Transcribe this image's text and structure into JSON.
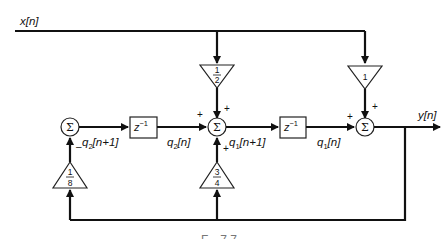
{
  "diagram": {
    "input_label": "x[n]",
    "output_label": "y[n]",
    "summers": [
      {
        "id": "sum1",
        "symbol": "Σ",
        "signs": {
          "feedback": "–"
        }
      },
      {
        "id": "sum2",
        "symbol": "Σ",
        "signs": {
          "left": "+",
          "top": "+",
          "bottom": "+"
        }
      },
      {
        "id": "sum3",
        "symbol": "Σ",
        "signs": {
          "left": "+",
          "top": "+"
        }
      }
    ],
    "delays": [
      {
        "id": "delay1",
        "label": "z",
        "exponent": "−1"
      },
      {
        "id": "delay2",
        "label": "z",
        "exponent": "−1"
      }
    ],
    "gains": [
      {
        "id": "gain-half",
        "numerator": "1",
        "denominator": "2"
      },
      {
        "id": "gain-one",
        "value": "1"
      },
      {
        "id": "gain-eighth",
        "numerator": "1",
        "denominator": "8"
      },
      {
        "id": "gain-three-quarters",
        "numerator": "3",
        "denominator": "4"
      }
    ],
    "signals": {
      "q2_next": {
        "base": "q",
        "sub": "2",
        "arg": "[n+1]"
      },
      "q2": {
        "base": "q",
        "sub": "2",
        "arg": "[n]"
      },
      "q1_next": {
        "base": "q",
        "sub": "1",
        "arg": "[n+1]"
      },
      "q1": {
        "base": "q",
        "sub": "1",
        "arg": "[n]"
      }
    },
    "caption": "F... 7.7..."
  }
}
